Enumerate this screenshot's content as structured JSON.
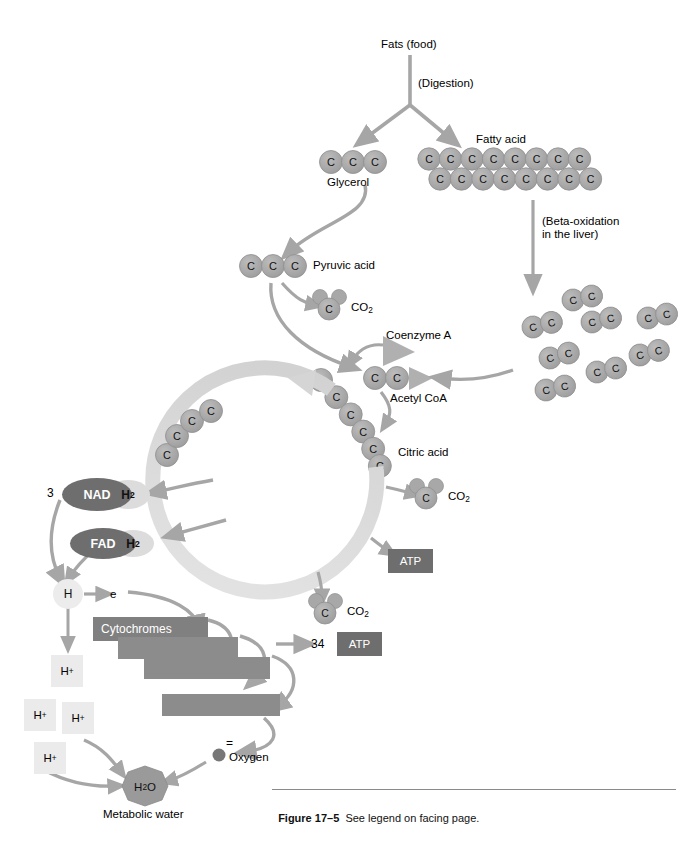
{
  "figure": {
    "number": "Figure 17–5",
    "caption": "See legend on facing page."
  },
  "colors": {
    "carbon_fill": "#a8a8a8",
    "carbon_stroke": "#8f8f8f",
    "arrow_gray": "#a6a6a6",
    "ring_light": "#d7d7d7",
    "dark_box": "#6e6e6e",
    "light_box": "#dcdcdc",
    "text_black": "#000000",
    "text_white": "#ffffff",
    "oxygen_dot": "#777777"
  },
  "labels": {
    "fats": "Fats (food)",
    "digestion": "(Digestion)",
    "glycerol": "Glycerol",
    "fatty_acid": "Fatty acid",
    "beta_oxidation": "(Beta-oxidation\nin the liver)",
    "pyruvic_acid": "Pyruvic acid",
    "coenzyme_a": "Coenzyme A",
    "acetyl_coa": "Acetyl CoA",
    "citric_acid": "Citric acid",
    "co2": "CO₂",
    "atp": "ATP",
    "nad": "NAD",
    "fad": "FAD",
    "h2": "H₂",
    "h": "H",
    "electron": "e",
    "cytochromes": "Cytochromes",
    "oxygen": "Oxygen",
    "water": "H₂O",
    "metabolic_water": "Metabolic water",
    "hplus": "H⁺",
    "count_nad": "3",
    "count_atp_etc": "34"
  },
  "chemistry": {
    "glycerol_carbons": 3,
    "fatty_acid_top_carbons": 8,
    "fatty_acid_bottom_carbons": 8,
    "pyruvic_acid_carbons": 3,
    "acetyl_coa_carbons": 2,
    "citric_acid_carbons": 6,
    "cycle_left_carbons": 4,
    "two_carbon_fragments": 8,
    "co2_count_total": 3,
    "atp_from_cycle": 1,
    "atp_from_etc": 34,
    "nad_molecules": 3,
    "hplus_ions": 4,
    "cytochrome_bars": 4
  }
}
